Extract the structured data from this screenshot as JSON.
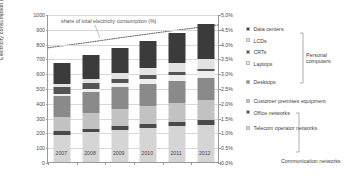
{
  "chart_data": {
    "type": "bar",
    "subtype": "stacked-bar-with-line",
    "title": "",
    "xlabel": "",
    "ylabel": "Electricity consumption (TWh/y)",
    "y2label": "",
    "categories": [
      "2007",
      "2008",
      "2009",
      "2010",
      "2011",
      "2012"
    ],
    "ylim": [
      0,
      1000
    ],
    "y2lim": [
      0,
      5
    ],
    "yticks": [
      "0",
      "100",
      "200",
      "300",
      "400",
      "500",
      "600",
      "700",
      "800",
      "900",
      "1000"
    ],
    "y2ticks": [
      "0.0%",
      "0.5%",
      "1.0%",
      "1.5%",
      "2.0%",
      "2.5%",
      "3.0%",
      "3.5%",
      "4.0%",
      "4.5%",
      "5.0%"
    ],
    "grid": true,
    "legend_position": "right",
    "annotation": "share of total electricity consumption (%)",
    "series": [
      {
        "name": "Telecom operator networks",
        "color": "#d5d5d5",
        "values": [
          185,
          200,
          215,
          228,
          240,
          250
        ]
      },
      {
        "name": "Office networks",
        "color": "#4a4a4a",
        "values": [
          24,
          26,
          28,
          30,
          32,
          34
        ]
      },
      {
        "name": "Customer premises equipment",
        "color": "#c2c2c2",
        "values": [
          96,
          104,
          112,
          120,
          128,
          136
        ]
      },
      {
        "name": "Desktops",
        "color": "#8a8a8a",
        "values": [
          140,
          145,
          150,
          152,
          150,
          148
        ]
      },
      {
        "name": "Laptops",
        "color": "#ededed",
        "values": [
          14,
          20,
          26,
          32,
          38,
          44
        ]
      },
      {
        "name": "CRTs",
        "color": "#545454",
        "values": [
          46,
          38,
          30,
          24,
          18,
          14
        ]
      },
      {
        "name": "LCDs",
        "color": "#e2e2e2",
        "values": [
          20,
          30,
          40,
          50,
          60,
          70
        ]
      },
      {
        "name": "Data centers",
        "color": "#3b3b3b",
        "values": [
          145,
          157,
          170,
          184,
          204,
          234
        ]
      }
    ],
    "share_series": {
      "name": "share of total electricity consumption (%)",
      "style": "dotted",
      "color": "#6e6e6e",
      "values": [
        3.95,
        4.08,
        4.22,
        4.35,
        4.48,
        4.6
      ]
    }
  },
  "legend": {
    "items": [
      {
        "label": "Data centers",
        "swatch": "#3b3b3b"
      },
      {
        "label": "LCDs",
        "swatch": "#e2e2e2"
      },
      {
        "label": "CRTs",
        "swatch": "#545454"
      },
      {
        "label": "Laptops",
        "swatch": "#ededed"
      },
      {
        "label": "Desktops",
        "swatch": "#8a8a8a"
      },
      {
        "label": "Customer premises equipment",
        "swatch": "#c2c2c2"
      },
      {
        "label": "Office networks",
        "swatch": "#4a4a4a"
      },
      {
        "label": "Telecom operator networks",
        "swatch": "#d5d5d5"
      }
    ],
    "groups": [
      {
        "label": "Personal computers"
      },
      {
        "label": "Communication networks"
      }
    ]
  }
}
